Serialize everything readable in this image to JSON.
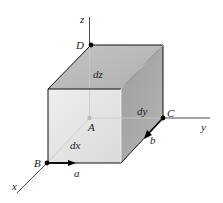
{
  "diagram": {
    "type": "3d-element-cube",
    "points": {
      "A": "A",
      "B": "B",
      "C": "C",
      "D": "D"
    },
    "axes": {
      "x": "x",
      "y": "y",
      "z": "z"
    },
    "dimensions": {
      "dx": "dx",
      "dy": "dy",
      "dz": "dz"
    },
    "vectors": {
      "a": "a",
      "b": "b"
    },
    "colors": {
      "top_face": "#bdbdbd",
      "front_face": "#e4e4e4",
      "right_face": "#a6a6a6",
      "edge": "#111111",
      "hidden_line": "#c8c8c8",
      "point": "#000000"
    }
  }
}
